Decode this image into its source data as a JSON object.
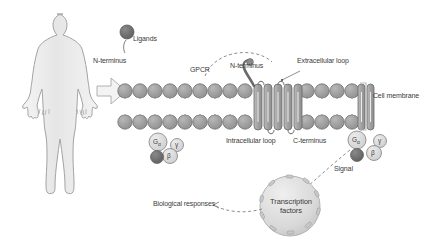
{
  "diagram": {
    "background_color": "#ffffff",
    "palette": {
      "body_fill": "#ebebeb",
      "body_stroke": "#9d9d9d",
      "lipid_head": "#9a9a9a",
      "lipid_stroke": "#6e6e6e",
      "helix_fill": "#a8a8a8",
      "helix_stroke": "#6a6a6a",
      "ligand_dark": "#6d6d6d",
      "subunit_fill": "#d6d6d6",
      "nucleus_fill": "#dcdcdc",
      "text": "#3b3b3b",
      "bracket": "#bdbdbd",
      "dashed": "#8d8d8d"
    },
    "labels": {
      "ligands": "Ligands",
      "n_terminus_left": "N-terminus",
      "gpcr": "GPCR",
      "n_terminus_right": "N-terminus",
      "extracellular_loop": "Extracellular loop",
      "cell_membrane": "Cell membrane",
      "intracellular_loop": "Intracellular loop",
      "c_terminus": "C-terminus",
      "signal": "Signal",
      "biological_responses": "Biological responses",
      "transcription_factors": "Transcription factors"
    },
    "g_protein_left": {
      "alpha": "G",
      "alpha_sub": "α",
      "gamma": "γ",
      "beta": "β"
    },
    "g_protein_right": {
      "alpha": "G",
      "alpha_sub": "α",
      "gamma": "γ",
      "beta": "β"
    },
    "icons": {
      "human": "human-silhouette-icon",
      "arrow": "block-arrow-right-icon",
      "ligand": "ligand-sphere-icon",
      "membrane": "lipid-bilayer-icon",
      "receptor": "seven-transmembrane-receptor-icon",
      "nucleus": "nucleus-icon"
    }
  }
}
